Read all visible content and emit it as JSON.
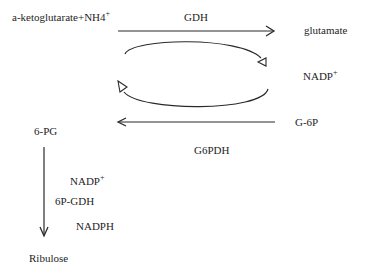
{
  "diagram": {
    "nodes": {
      "substrate": {
        "text": "a-ketoglutarate+NH4",
        "sup": "+"
      },
      "product": {
        "text": "glutamate"
      },
      "cofactor_right": {
        "text": "NADP",
        "sup": "+"
      },
      "g6p": {
        "text": "G-6P"
      },
      "pg6": {
        "text": "6-PG"
      },
      "ribulose": {
        "text": "Ribulose"
      }
    },
    "enzymes": {
      "gdh": "GDH",
      "g6pdh": "G6PDH",
      "pgdh": "6P-GDH"
    },
    "cofactors_left": {
      "nadp": {
        "text": "NADP",
        "sup": "+"
      },
      "nadph": {
        "text": "NADPH"
      }
    },
    "edges": [
      {
        "from": "a-ketoglutarate+NH4+",
        "to": "glutamate",
        "label": "GDH",
        "direction": "right"
      },
      {
        "from": "G-6P",
        "to": "6-PG",
        "label": "G6PDH",
        "direction": "left"
      },
      {
        "from": "6-PG",
        "to": "Ribulose",
        "label": "6P-GDH",
        "direction": "down"
      },
      {
        "type": "cycle",
        "description": "NADPH/NADP+ recycling loop",
        "direction": "clockwise"
      }
    ]
  }
}
